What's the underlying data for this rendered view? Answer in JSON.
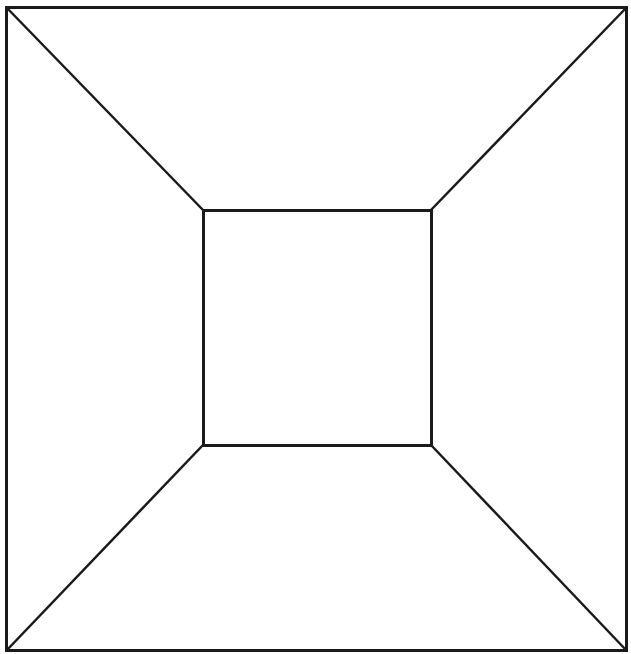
{
  "diagram": {
    "stroke_color": "#1a1a1a",
    "background": "#ffffff",
    "outer_square": {
      "x1": 6,
      "y1": 7,
      "x2": 626,
      "y2": 650
    },
    "inner_square": {
      "x1": 203,
      "y1": 210,
      "x2": 431,
      "y2": 445
    }
  }
}
